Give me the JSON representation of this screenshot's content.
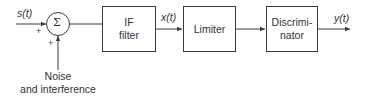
{
  "diagram": {
    "input_signal": "s(t)",
    "summer": {
      "symbol": "Σ",
      "plus_left": "+",
      "plus_bottom": "+"
    },
    "noise_label_line1": "Noise",
    "noise_label_line2": "and interference",
    "blocks": [
      {
        "id": "if-filter",
        "line1": "IF",
        "line2": "filter"
      },
      {
        "id": "limiter",
        "line1": "Limiter",
        "line2": ""
      },
      {
        "id": "discriminator",
        "line1": "Discrimi-",
        "line2": "nator"
      }
    ],
    "intermediate_signal": "x(t)",
    "output_signal": "y(t)",
    "line_color": "#3a3a3a"
  }
}
